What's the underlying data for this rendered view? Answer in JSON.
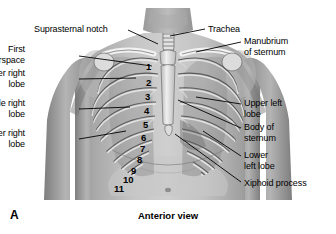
{
  "figure": {
    "panel_letter": "A",
    "caption": "Anterior view",
    "background_color": "#ffffff",
    "line_color": "#000000"
  },
  "labels": [
    {
      "id": "suprasternal-notch",
      "text": "Suprasternal notch",
      "align": "left",
      "x": 34,
      "y": 24,
      "leader": [
        [
          128,
          30
        ],
        [
          158,
          44
        ]
      ]
    },
    {
      "id": "trachea",
      "text": "Trachea",
      "align": "left",
      "x": 208,
      "y": 24,
      "leader": [
        [
          205,
          29
        ],
        [
          170,
          36
        ]
      ]
    },
    {
      "id": "manubrium-of-sternum",
      "text": "Manubrium\nof sternum",
      "align": "left",
      "x": 244,
      "y": 36,
      "leader": [
        [
          241,
          42
        ],
        [
          196,
          52
        ]
      ]
    },
    {
      "id": "first-interspace",
      "text": "First\ninterspace",
      "align": "right",
      "x": 25,
      "y": 44,
      "leader": [
        [
          79,
          56
        ],
        [
          152,
          66
        ]
      ]
    },
    {
      "id": "upper-right-lobe",
      "text": "Upper right\nlobe",
      "align": "right",
      "x": 25,
      "y": 68,
      "leader": [
        [
          79,
          79
        ],
        [
          136,
          78
        ]
      ]
    },
    {
      "id": "middle-right-lobe",
      "text": "Middle right\nlobe",
      "align": "right",
      "x": 25,
      "y": 98,
      "leader": [
        [
          79,
          109
        ],
        [
          130,
          107
        ]
      ]
    },
    {
      "id": "lower-right-lobe",
      "text": "Lower right\nlobe",
      "align": "right",
      "x": 25,
      "y": 128,
      "leader": [
        [
          79,
          139
        ],
        [
          126,
          131
        ]
      ]
    },
    {
      "id": "upper-left-lobe",
      "text": "Upper left\nlobe",
      "align": "left",
      "x": 244,
      "y": 98,
      "leader": [
        [
          241,
          104
        ],
        [
          196,
          97
        ]
      ]
    },
    {
      "id": "body-of-sternum",
      "text": "Body of\nsternum",
      "align": "left",
      "x": 244,
      "y": 122,
      "leader": [
        [
          241,
          128
        ],
        [
          178,
          100
        ]
      ]
    },
    {
      "id": "lower-left-lobe",
      "text": "Lower\nleft lobe",
      "align": "left",
      "x": 244,
      "y": 150,
      "leader": [
        [
          241,
          156
        ],
        [
          203,
          131
        ]
      ]
    },
    {
      "id": "xiphoid-process",
      "text": "Xiphoid process",
      "align": "left",
      "x": 244,
      "y": 178,
      "leader": [
        [
          241,
          182
        ],
        [
          175,
          134
        ]
      ]
    }
  ],
  "rib_numbers": [
    {
      "n": "1",
      "x": 146,
      "y": 62
    },
    {
      "n": "2",
      "x": 146,
      "y": 78
    },
    {
      "n": "3",
      "x": 145,
      "y": 92
    },
    {
      "n": "4",
      "x": 144,
      "y": 106
    },
    {
      "n": "5",
      "x": 143,
      "y": 120
    },
    {
      "n": "6",
      "x": 141,
      "y": 133
    },
    {
      "n": "7",
      "x": 140,
      "y": 144
    },
    {
      "n": "8",
      "x": 137,
      "y": 155
    },
    {
      "n": "9",
      "x": 131,
      "y": 166
    },
    {
      "n": "10",
      "x": 123,
      "y": 175
    },
    {
      "n": "11",
      "x": 114,
      "y": 184
    }
  ]
}
